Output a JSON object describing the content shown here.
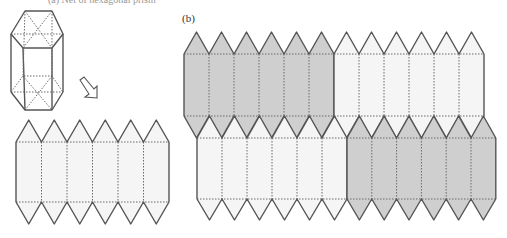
{
  "figure": {
    "caption_partial": "(a) Net of hexagonal prism",
    "panel_b_label": "(b)"
  },
  "colors": {
    "stroke": "#555555",
    "fold_line": "#6a6a6a",
    "gray_fill": "#cfcfcf",
    "white_fill": "#f5f5f5"
  },
  "prism": {
    "top_hexagon": [
      [
        25,
        11
      ],
      [
        52,
        11
      ],
      [
        63,
        34
      ],
      [
        52,
        48
      ],
      [
        23,
        48
      ],
      [
        11,
        34
      ]
    ],
    "bottom_hexagon": [
      [
        11,
        92
      ],
      [
        23,
        76
      ],
      [
        52,
        76
      ],
      [
        63,
        92
      ],
      [
        52,
        110
      ],
      [
        25,
        110
      ]
    ]
  },
  "arrow": {
    "from": [
      82,
      80
    ],
    "to": [
      95,
      96
    ]
  },
  "nets": [
    {
      "name": "left-net",
      "x": 16,
      "top_peak": 120,
      "top": 142,
      "bottom": 202,
      "tip": 224,
      "col_w": 25.5,
      "cols": 6,
      "fill": "white"
    },
    {
      "name": "right-top-gray",
      "x": 184,
      "top_peak": 32,
      "top": 54,
      "bottom": 116,
      "tip": 138,
      "col_w": 25,
      "cols": 6,
      "fill": "gray"
    },
    {
      "name": "right-top-white",
      "x": 334,
      "top_peak": 32,
      "top": 54,
      "bottom": 116,
      "tip": 138,
      "col_w": 25,
      "cols": 6,
      "fill": "white"
    },
    {
      "name": "right-bottom-white",
      "x": 197,
      "top_peak": 116,
      "top": 138,
      "bottom": 199,
      "tip": 220,
      "col_w": 25,
      "cols": 6,
      "fill": "white"
    },
    {
      "name": "right-bottom-gray",
      "x": 347,
      "top_peak": 116,
      "top": 138,
      "bottom": 199,
      "tip": 220,
      "col_w": 24.8,
      "cols": 6,
      "fill": "gray"
    }
  ]
}
